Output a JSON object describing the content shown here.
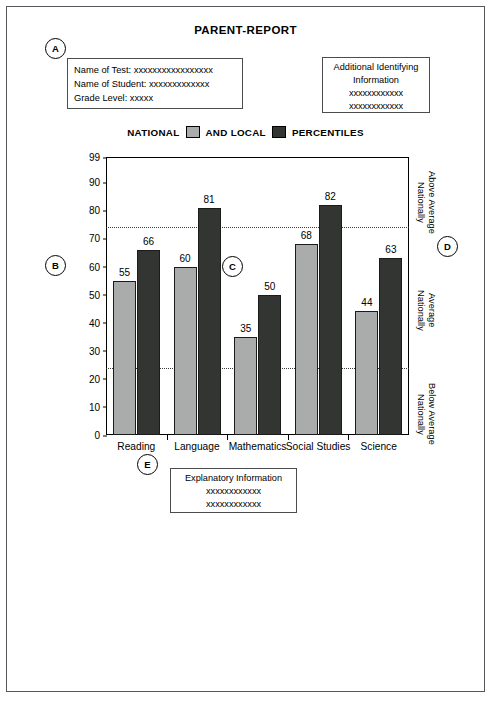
{
  "report": {
    "title": "PARENT-REPORT"
  },
  "markers": {
    "a": "A",
    "b": "B",
    "c": "C",
    "d": "D",
    "e": "E"
  },
  "student_box": {
    "test_line": "Name of Test: xxxxxxxxxxxxxxxxx",
    "student_line": "Name of Student: xxxxxxxxxxxxx",
    "grade_line": "Grade Level: xxxxx"
  },
  "additional_box": {
    "title_line1": "Additional Identifying",
    "title_line2": "Information",
    "xline1": "xxxxxxxxxxxx",
    "xline2": "xxxxxxxxxxxx"
  },
  "legend": {
    "national_label": "NATIONAL",
    "and_local_label": "AND LOCAL",
    "percentiles_label": "PERCENTILES",
    "national_color": "#aaacab",
    "local_color": "#333533"
  },
  "bands": {
    "above": "Above Average\nNationally",
    "average": "Average\nNationally",
    "below": "Below Average\nNationally"
  },
  "explanatory_box": {
    "title": "Explanatory Information",
    "xline1": "xxxxxxxxxxxx",
    "xline2": "xxxxxxxxxxxx"
  },
  "chart_data": {
    "type": "bar",
    "title": "",
    "xlabel": "",
    "ylabel": "",
    "ylim": [
      0,
      99
    ],
    "yticks": [
      0,
      10,
      20,
      30,
      40,
      50,
      60,
      70,
      80,
      90,
      99
    ],
    "grid": false,
    "legend_position": "above-plot",
    "categories": [
      "Reading",
      "Language",
      "Mathematics",
      "Social Studies",
      "Science"
    ],
    "series": [
      {
        "name": "NATIONAL",
        "color": "#aaacab",
        "values": [
          55,
          60,
          35,
          68,
          44
        ]
      },
      {
        "name": "LOCAL",
        "color": "#333533",
        "values": [
          66,
          81,
          50,
          82,
          63
        ]
      }
    ],
    "reference_lines": [
      {
        "value": 74,
        "style": "dotted",
        "label": "Above Average Nationally boundary"
      },
      {
        "value": 24,
        "style": "dotted",
        "label": "Below Average Nationally boundary"
      }
    ]
  }
}
